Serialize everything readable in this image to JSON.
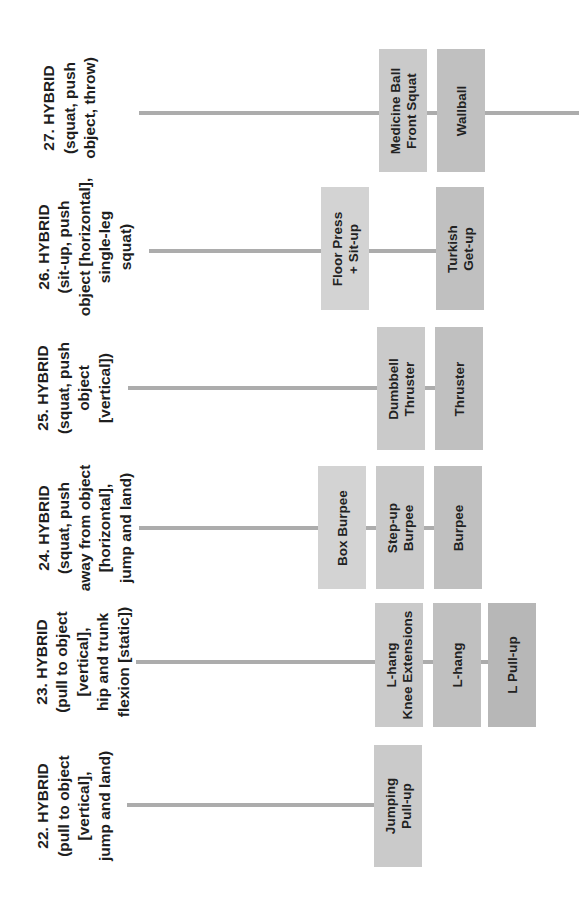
{
  "colors": {
    "line": "#acacac",
    "box_col0": "#d3d3d3",
    "box_col1": "#cacaca",
    "box_col2": "#c0c0c0",
    "box_col3": "#b7b7b7",
    "text": "#1e1e1e"
  },
  "rows": [
    {
      "id": "27",
      "label": "27. HYBRID\n(squat, push\nobject, throw)",
      "boxes": [
        {
          "text": "Medicine Ball\nFront Squat"
        },
        {
          "text": "Wallball"
        }
      ]
    },
    {
      "id": "26",
      "label": "26. HYBRID\n(sit-up, push\nobject [horizontal],\nsingle-leg\nsquat)",
      "boxes": [
        {
          "text": "Floor Press\n+ Sit-up"
        },
        {
          "text": "Turkish\nGet-up"
        }
      ]
    },
    {
      "id": "25",
      "label": "25. HYBRID\n(squat, push\nobject\n[vertical])",
      "boxes": [
        {
          "text": "Dumbbell\nThruster"
        },
        {
          "text": "Thruster"
        }
      ]
    },
    {
      "id": "24",
      "label": "24. HYBRID\n(squat, push\naway from object\n[horizontal],\njump and land)",
      "boxes": [
        {
          "text": "Box Burpee"
        },
        {
          "text": "Step-up\nBurpee"
        },
        {
          "text": "Burpee"
        }
      ]
    },
    {
      "id": "23",
      "label": "23. HYBRID\n(pull to object\n[vertical],\nhip and trunk\nflexion [static])",
      "boxes": [
        {
          "text": "L-hang\nKnee Extensions"
        },
        {
          "text": "L-hang"
        },
        {
          "text": "L Pull-up"
        }
      ]
    },
    {
      "id": "22",
      "label": "22. HYBRID\n(pull to object\n[vertical],\njump and land)",
      "boxes": [
        {
          "text": "Jumping\nPull-up"
        }
      ]
    }
  ]
}
